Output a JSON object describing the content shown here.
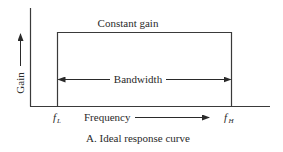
{
  "diagram": {
    "caption": "A. Ideal response curve",
    "y_axis_label": "Gain",
    "x_axis_label": "Frequency",
    "curve_label": "Constant gain",
    "span_label": "Bandwidth",
    "low_freq_label": "f",
    "low_freq_sub": "L",
    "high_freq_label": "f",
    "high_freq_sub": "H",
    "colors": {
      "line": "#3a3a3a",
      "text": "#2a2a2a",
      "background": "#ffffff"
    }
  }
}
